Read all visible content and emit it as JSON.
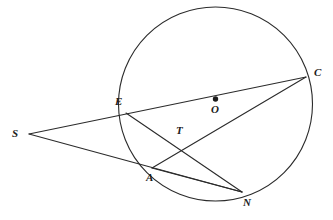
{
  "figure": {
    "kind": "circle-geometry-diagram",
    "background_color": "#ffffff",
    "stroke_color": "#2b2b2b",
    "label_color": "#1b1b1b"
  },
  "circle": {
    "name": "circle-O",
    "center_label": "O",
    "center": {
      "x": 215.5,
      "y": 104.0
    },
    "radius": 97.0,
    "center_dot_radius": 2.7
  },
  "points": [
    {
      "id": "S",
      "label": "S",
      "x": 29.0,
      "y": 134.0,
      "label_x": 12.0,
      "label_y": 128.0,
      "on_circle": false,
      "external": true
    },
    {
      "id": "E",
      "label": "E",
      "x": 126.0,
      "y": 113.0,
      "label_x": 115.0,
      "label_y": 96.0,
      "on_circle": true,
      "external": false
    },
    {
      "id": "C",
      "label": "C",
      "x": 306.0,
      "y": 77.0,
      "label_x": 314.0,
      "label_y": 67.0,
      "on_circle": true,
      "external": false
    },
    {
      "id": "A",
      "label": "A",
      "x": 152.0,
      "y": 168.0,
      "label_x": 146.0,
      "label_y": 172.0,
      "on_circle": true,
      "external": false
    },
    {
      "id": "N",
      "label": "N",
      "x": 242.0,
      "y": 192.0,
      "label_x": 243.0,
      "label_y": 197.0,
      "on_circle": true,
      "external": false
    },
    {
      "id": "T",
      "label": "T",
      "x": 181.0,
      "y": 141.0,
      "label_x": 176.0,
      "label_y": 125.0,
      "on_circle": false,
      "external": false
    },
    {
      "id": "O",
      "label": "O",
      "x": 215.5,
      "y": 99.0,
      "label_x": 211.0,
      "label_y": 104.0,
      "on_circle": false,
      "external": false
    }
  ],
  "segments": [
    {
      "id": "SC",
      "name": "secant-S-E-C",
      "from": "S",
      "to": "C",
      "x1": 29.0,
      "y1": 134.0,
      "x2": 306.0,
      "y2": 77.0,
      "through": [
        "E"
      ]
    },
    {
      "id": "SN",
      "name": "secant-S-A-N",
      "from": "S",
      "to": "N",
      "x1": 29.0,
      "y1": 134.0,
      "x2": 242.0,
      "y2": 192.0,
      "through": [
        "A"
      ]
    },
    {
      "id": "EN",
      "name": "chord-E-N",
      "from": "E",
      "to": "N",
      "x1": 126.0,
      "y1": 113.0,
      "x2": 242.0,
      "y2": 192.0,
      "through": [
        "T"
      ]
    },
    {
      "id": "AC",
      "name": "chord-A-C",
      "from": "A",
      "to": "C",
      "x1": 152.0,
      "y1": 168.0,
      "x2": 306.0,
      "y2": 77.0,
      "through": [
        "T"
      ]
    },
    {
      "id": "AN",
      "name": "chord-A-N",
      "from": "A",
      "to": "N",
      "x1": 152.0,
      "y1": 168.0,
      "x2": 242.0,
      "y2": 192.0,
      "through": []
    }
  ]
}
